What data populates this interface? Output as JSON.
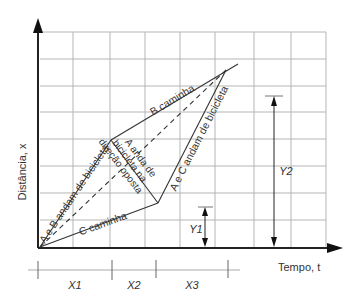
{
  "axes": {
    "y_label": "Distância, x",
    "x_label": "Tempo, t"
  },
  "lines": {
    "ab_bike": "A e B andam de bicicleta",
    "b_walk": "B caminha",
    "c_walk": "C caminha",
    "a_opposite_line1": "A anda de",
    "a_opposite_line2": "bicicleta na",
    "a_opposite_line3": "direção oposta",
    "ac_bike": "A e C andam de bicicleta"
  },
  "intervals": {
    "x1": "X1",
    "x2": "X2",
    "x3": "X3",
    "y1": "Y1",
    "y2": "Y2"
  },
  "colors": {
    "grid": "#b0b0b0",
    "line": "#333333",
    "axis": "#222222"
  }
}
